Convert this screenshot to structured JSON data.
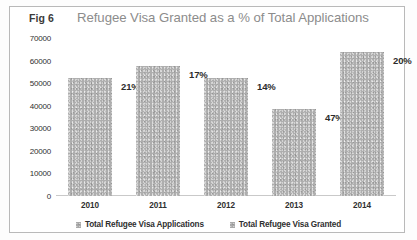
{
  "figure": {
    "fig_number": "Fig 6",
    "border_color": "#b9b9b9",
    "bar_color": "#aeaeae"
  },
  "chart_data": {
    "type": "bar",
    "title": "Refugee Visa Granted as a % of Total Applications",
    "xlabel": "",
    "ylabel": "",
    "categories": [
      "2010",
      "2011",
      "2012",
      "2013",
      "2014"
    ],
    "values": [
      52400,
      57500,
      52400,
      38500,
      64000
    ],
    "data_labels": [
      "21%",
      "17%",
      "14%",
      "47%",
      "20%"
    ],
    "series": [
      {
        "name": "Total Refugee Visa Applications",
        "values": [
          52400,
          57500,
          52400,
          38500,
          64000
        ]
      },
      {
        "name": "Total Refugee Visa Granted",
        "values": [
          11004,
          9775,
          7336,
          18095,
          12800
        ]
      }
    ],
    "ylim": [
      0,
      70000
    ],
    "yticks": [
      "70000",
      "60000",
      "50000",
      "40000",
      "30000",
      "20000",
      "10000",
      "0"
    ],
    "ytick_values": [
      70000,
      60000,
      50000,
      40000,
      30000,
      20000,
      10000,
      0
    ],
    "grid": false,
    "legend_position": "bottom",
    "legend": [
      "Total Refugee Visa Applications",
      "Total Refugee Visa Granted"
    ]
  }
}
